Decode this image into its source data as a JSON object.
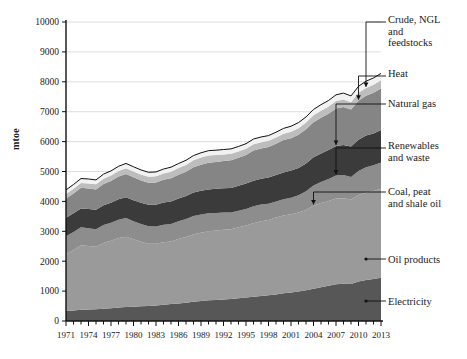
{
  "chart_data": {
    "type": "area",
    "title": "",
    "xlabel": "",
    "ylabel": "mtoe",
    "ylim": [
      0,
      10000
    ],
    "xlim": [
      1971,
      2013
    ],
    "grid": true,
    "legend_position": "right-callouts",
    "ytick_labels": [
      "0",
      "1000",
      "2000",
      "3000",
      "4000",
      "5000",
      "6000",
      "7000",
      "8000",
      "9000",
      "10000"
    ],
    "ytick_values": [
      0,
      1000,
      2000,
      3000,
      4000,
      5000,
      6000,
      7000,
      8000,
      9000,
      10000
    ],
    "xtick_labels": [
      "1971",
      "1974",
      "1977",
      "1980",
      "1983",
      "1986",
      "1989",
      "1992",
      "1995",
      "1998",
      "2001",
      "2004",
      "2007",
      "2010",
      "2013"
    ],
    "xtick_values": [
      1971,
      1974,
      1977,
      1980,
      1983,
      1986,
      1989,
      1992,
      1995,
      1998,
      2001,
      2004,
      2007,
      2010,
      2013
    ],
    "x": [
      1971,
      1972,
      1973,
      1974,
      1975,
      1976,
      1977,
      1978,
      1979,
      1980,
      1981,
      1982,
      1983,
      1984,
      1985,
      1986,
      1987,
      1988,
      1989,
      1990,
      1991,
      1992,
      1993,
      1994,
      1995,
      1996,
      1997,
      1998,
      1999,
      2000,
      2001,
      2002,
      2003,
      2004,
      2005,
      2006,
      2007,
      2008,
      2009,
      2010,
      2011,
      2012,
      2013
    ],
    "stack_order_bottom_to_top": [
      "Electricity",
      "Oil products",
      "Coal, peat and shale oil",
      "Renewables and waste",
      "Natural gas",
      "Heat",
      "Crude, NGL and feedstocks"
    ],
    "series": [
      {
        "name": "Electricity",
        "color": "#575757",
        "values": [
          335,
          355,
          380,
          385,
          390,
          410,
          430,
          450,
          470,
          480,
          490,
          500,
          520,
          545,
          565,
          585,
          610,
          640,
          665,
          690,
          705,
          715,
          735,
          760,
          785,
          810,
          835,
          860,
          890,
          930,
          950,
          985,
          1030,
          1080,
          1125,
          1175,
          1225,
          1250,
          1240,
          1320,
          1370,
          1405,
          1450
        ]
      },
      {
        "name": "Oil products",
        "color": "#9a9a9a",
        "values": [
          1900,
          2020,
          2150,
          2125,
          2090,
          2200,
          2250,
          2330,
          2350,
          2250,
          2160,
          2080,
          2060,
          2085,
          2090,
          2160,
          2200,
          2260,
          2290,
          2310,
          2320,
          2340,
          2330,
          2375,
          2405,
          2460,
          2500,
          2520,
          2570,
          2600,
          2620,
          2640,
          2680,
          2780,
          2820,
          2840,
          2875,
          2855,
          2820,
          2890,
          2920,
          2940,
          2975
        ]
      },
      {
        "name": "Coal, peat and shale oil",
        "color": "#8d8d8d",
        "values": [
          600,
          600,
          605,
          595,
          590,
          600,
          605,
          610,
          625,
          610,
          595,
          585,
          580,
          590,
          590,
          595,
          600,
          615,
          610,
          600,
          590,
          570,
          560,
          555,
          560,
          565,
          560,
          545,
          540,
          545,
          555,
          580,
          630,
          670,
          700,
          730,
          765,
          780,
          760,
          810,
          855,
          865,
          880
        ]
      },
      {
        "name": "Renewables and waste",
        "color": "#3b3b3b",
        "values": [
          620,
          625,
          630,
          640,
          650,
          660,
          670,
          680,
          690,
          700,
          710,
          720,
          730,
          740,
          750,
          760,
          770,
          780,
          790,
          800,
          805,
          815,
          825,
          835,
          845,
          855,
          865,
          875,
          885,
          895,
          905,
          915,
          930,
          945,
          960,
          975,
          990,
          1005,
          1015,
          1040,
          1055,
          1065,
          1080
        ]
      },
      {
        "name": "Natural gas",
        "color": "#858585",
        "values": [
          640,
          665,
          690,
          690,
          680,
          715,
          730,
          760,
          785,
          765,
          745,
          735,
          740,
          760,
          780,
          790,
          810,
          845,
          870,
          890,
          900,
          910,
          925,
          935,
          960,
          1010,
          1010,
          1020,
          1045,
          1080,
          1085,
          1110,
          1140,
          1175,
          1195,
          1210,
          1255,
          1270,
          1240,
          1310,
          1330,
          1355,
          1390
        ]
      },
      {
        "name": "Heat",
        "color": "#bdbdbd",
        "values": [
          150,
          155,
          160,
          165,
          170,
          175,
          180,
          185,
          190,
          195,
          200,
          205,
          210,
          215,
          220,
          225,
          230,
          235,
          240,
          245,
          230,
          220,
          215,
          210,
          205,
          215,
          210,
          205,
          205,
          210,
          215,
          220,
          225,
          230,
          235,
          240,
          245,
          250,
          245,
          260,
          265,
          270,
          275
        ]
      },
      {
        "name": "Crude, NGL and feedstocks",
        "color": "#f2f2f2",
        "values": [
          140,
          145,
          150,
          150,
          148,
          152,
          155,
          158,
          160,
          158,
          152,
          148,
          145,
          148,
          150,
          152,
          155,
          158,
          160,
          162,
          163,
          165,
          166,
          168,
          170,
          172,
          174,
          176,
          178,
          182,
          184,
          186,
          190,
          196,
          200,
          204,
          210,
          212,
          208,
          218,
          224,
          228,
          232
        ]
      }
    ],
    "totals_note": "Stacked total rises from about 4385 mtoe in 1971 to about 8282 mtoe in 2013"
  },
  "legend": {
    "items": [
      {
        "label": "Crude, NGL\nand\nfeedstocks"
      },
      {
        "label": "Heat"
      },
      {
        "label": "Natural gas"
      },
      {
        "label": "Renewables\nand waste"
      },
      {
        "label": "Coal, peat\nand shale oil"
      },
      {
        "label": "Oil products"
      },
      {
        "label": "Electricity"
      }
    ]
  }
}
